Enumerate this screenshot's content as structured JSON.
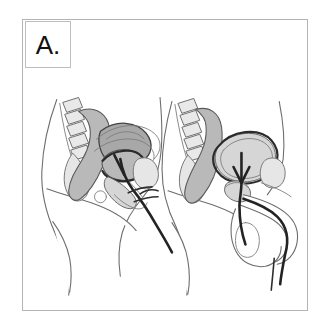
{
  "panel": {
    "label": "A.",
    "label_box_name": "panel-label-box",
    "border_color": "#b4b4b4",
    "background_color": "#ffffff"
  },
  "illustration": {
    "title": "Urinary catheterization anatomy",
    "style": "grayscale line art, sagittal cross-section",
    "figures": [
      {
        "id": "female-figure",
        "position": "left",
        "caption": "Female pelvic sagittal section with urinary catheter",
        "structures": [
          "abdominal-wall-outline",
          "lumbar-vertebrae",
          "sacrum",
          "rectum",
          "sigmoid-colon",
          "uterus",
          "urinary-bladder",
          "pubic-symphysis",
          "vagina",
          "urethra",
          "catheter-tube",
          "thigh-outline"
        ]
      },
      {
        "id": "male-figure",
        "position": "right",
        "caption": "Male pelvic sagittal section with urinary catheter",
        "structures": [
          "abdominal-wall-outline",
          "lumbar-vertebrae",
          "sacrum",
          "rectum",
          "urinary-bladder",
          "prostate-gland",
          "pubic-symphysis",
          "penis",
          "scrotum",
          "testis",
          "urethra",
          "catheter-tube",
          "thigh-outline"
        ]
      }
    ],
    "colors": {
      "organ_mid_gray": "#b9b9b9",
      "organ_light_gray": "#d6d6d6",
      "organ_pale_gray": "#e6e6e6",
      "organ_dark_gray": "#a8a8a8",
      "outline_gray": "#6d6d6d",
      "catheter_black": "#232323"
    }
  }
}
